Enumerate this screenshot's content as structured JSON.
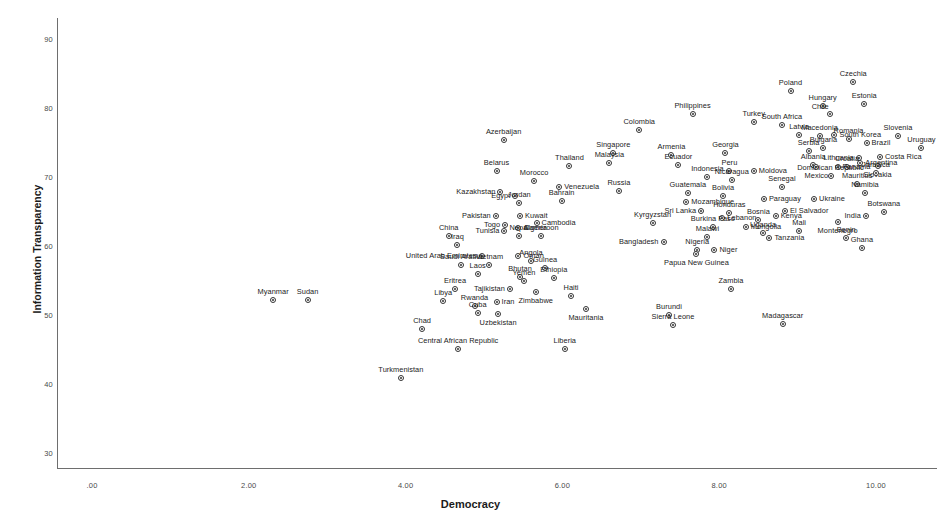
{
  "chart_data": {
    "type": "scatter",
    "title": "",
    "xlabel": "Democracy",
    "ylabel": "Information Transparency",
    "xlim": [
      -0.45,
      10.8
    ],
    "ylim": [
      27.8,
      92.0
    ],
    "xticks": [
      ".00",
      "2.00",
      "4.00",
      "6.00",
      "8.00",
      "10.00"
    ],
    "xtick_values": [
      0,
      2,
      4,
      6,
      8,
      10
    ],
    "yticks": [
      "30",
      "40",
      "50",
      "60",
      "70",
      "80",
      "90"
    ],
    "ytick_values": [
      30,
      40,
      50,
      60,
      70,
      80,
      90
    ],
    "grid": false,
    "legend": null,
    "marker_color": "#333333",
    "points": [
      {
        "label": "Czechia",
        "x": 9.71,
        "y": 83.8,
        "pos": "t"
      },
      {
        "label": "Poland",
        "x": 8.91,
        "y": 82.5,
        "pos": "t"
      },
      {
        "label": "Estonia",
        "x": 9.85,
        "y": 80.6,
        "pos": "t"
      },
      {
        "label": "Hungary",
        "x": 9.32,
        "y": 80.3,
        "pos": "t"
      },
      {
        "label": "Chile",
        "x": 9.41,
        "y": 79.1,
        "pos": "tl"
      },
      {
        "label": "Philippines",
        "x": 7.66,
        "y": 79.1,
        "pos": "t"
      },
      {
        "label": "South Africa",
        "x": 8.8,
        "y": 77.5,
        "pos": "t"
      },
      {
        "label": "Turkey",
        "x": 8.44,
        "y": 78.0,
        "pos": "t"
      },
      {
        "label": "Colombia",
        "x": 6.98,
        "y": 76.8,
        "pos": "t"
      },
      {
        "label": "Latvia",
        "x": 9.02,
        "y": 76.1,
        "pos": "t"
      },
      {
        "label": "South Korea",
        "x": 9.47,
        "y": 76.1,
        "pos": "r"
      },
      {
        "label": "Macedonia",
        "x": 9.28,
        "y": 76.0,
        "pos": "t"
      },
      {
        "label": "Slovenia",
        "x": 10.28,
        "y": 76.0,
        "pos": "t"
      },
      {
        "label": "Romania",
        "x": 9.65,
        "y": 75.5,
        "pos": "t"
      },
      {
        "label": "Azerbaijan",
        "x": 5.25,
        "y": 75.4,
        "pos": "t"
      },
      {
        "label": "Brazil",
        "x": 9.88,
        "y": 74.9,
        "pos": "r"
      },
      {
        "label": "Bulgaria",
        "x": 9.33,
        "y": 74.2,
        "pos": "t"
      },
      {
        "label": "Uruguay",
        "x": 10.58,
        "y": 74.2,
        "pos": "t"
      },
      {
        "label": "Singapore",
        "x": 6.65,
        "y": 73.5,
        "pos": "t"
      },
      {
        "label": "Serbia",
        "x": 9.14,
        "y": 73.7,
        "pos": "t"
      },
      {
        "label": "Armenia",
        "x": 7.39,
        "y": 73.2,
        "pos": "t"
      },
      {
        "label": "Georgia",
        "x": 8.08,
        "y": 73.5,
        "pos": "t"
      },
      {
        "label": "Costa Rica",
        "x": 10.05,
        "y": 72.9,
        "pos": "r"
      },
      {
        "label": "Lithuania",
        "x": 9.78,
        "y": 72.7,
        "pos": "l"
      },
      {
        "label": "Argentina",
        "x": 9.8,
        "y": 72.1,
        "pos": "r"
      },
      {
        "label": "Malaysia",
        "x": 6.6,
        "y": 72.0,
        "pos": "t"
      },
      {
        "label": "Albania",
        "x": 9.2,
        "y": 71.8,
        "pos": "t"
      },
      {
        "label": "Ecuador",
        "x": 7.48,
        "y": 71.8,
        "pos": "t"
      },
      {
        "label": "Slovakia",
        "x": 10.02,
        "y": 71.6,
        "pos": "b"
      },
      {
        "label": "Croatia",
        "x": 9.63,
        "y": 71.4,
        "pos": "t"
      },
      {
        "label": "Thailand",
        "x": 6.09,
        "y": 71.6,
        "pos": "t"
      },
      {
        "label": "Mexico",
        "x": 9.24,
        "y": 71.4,
        "pos": "b"
      },
      {
        "label": "Panama",
        "x": 9.51,
        "y": 71.4,
        "pos": "r"
      },
      {
        "label": "Belarus",
        "x": 5.16,
        "y": 70.8,
        "pos": "t"
      },
      {
        "label": "Jamaica",
        "x": 10.0,
        "y": 70.6,
        "pos": "t"
      },
      {
        "label": "Peru",
        "x": 8.13,
        "y": 70.9,
        "pos": "t"
      },
      {
        "label": "Moldova",
        "x": 8.44,
        "y": 70.8,
        "pos": "r"
      },
      {
        "label": "Dominican Republic",
        "x": 9.42,
        "y": 70.2,
        "pos": "t"
      },
      {
        "label": "Indonesia",
        "x": 7.85,
        "y": 70.0,
        "pos": "t"
      },
      {
        "label": "Morocco",
        "x": 5.64,
        "y": 69.4,
        "pos": "t"
      },
      {
        "label": "Nicaragua",
        "x": 8.16,
        "y": 69.5,
        "pos": "t"
      },
      {
        "label": "Mauritius",
        "x": 9.76,
        "y": 69.0,
        "pos": "t"
      },
      {
        "label": "Venezuela",
        "x": 5.96,
        "y": 68.6,
        "pos": "r"
      },
      {
        "label": "Senegal",
        "x": 8.8,
        "y": 68.6,
        "pos": "t"
      },
      {
        "label": "Kazakhstan",
        "x": 5.21,
        "y": 67.8,
        "pos": "l"
      },
      {
        "label": "Russia",
        "x": 6.72,
        "y": 67.9,
        "pos": "t"
      },
      {
        "label": "Namibia",
        "x": 9.86,
        "y": 67.7,
        "pos": "t"
      },
      {
        "label": "Guatemala",
        "x": 7.6,
        "y": 67.7,
        "pos": "t"
      },
      {
        "label": "Egypt",
        "x": 5.4,
        "y": 67.3,
        "pos": "l"
      },
      {
        "label": "Bolivia",
        "x": 8.05,
        "y": 67.2,
        "pos": "t"
      },
      {
        "label": "Paraguay",
        "x": 8.57,
        "y": 66.8,
        "pos": "r"
      },
      {
        "label": "Ukraine",
        "x": 9.21,
        "y": 66.8,
        "pos": "r"
      },
      {
        "label": "Bahrain",
        "x": 5.99,
        "y": 66.5,
        "pos": "t"
      },
      {
        "label": "Mozambique",
        "x": 7.58,
        "y": 66.4,
        "pos": "r"
      },
      {
        "label": "Jordan",
        "x": 5.45,
        "y": 66.2,
        "pos": "t"
      },
      {
        "label": "Botswana",
        "x": 10.1,
        "y": 65.0,
        "pos": "t"
      },
      {
        "label": "Sri Lanka",
        "x": 7.77,
        "y": 65.1,
        "pos": "l"
      },
      {
        "label": "Honduras",
        "x": 8.13,
        "y": 64.8,
        "pos": "t"
      },
      {
        "label": "El Salvador",
        "x": 8.84,
        "y": 65.1,
        "pos": "r"
      },
      {
        "label": "India",
        "x": 9.87,
        "y": 64.3,
        "pos": "l"
      },
      {
        "label": "Pakistan",
        "x": 5.15,
        "y": 64.4,
        "pos": "l"
      },
      {
        "label": "Kuwait",
        "x": 5.46,
        "y": 64.3,
        "pos": "r"
      },
      {
        "label": "Kenya",
        "x": 8.72,
        "y": 64.4,
        "pos": "r"
      },
      {
        "label": "Lebanon",
        "x": 8.04,
        "y": 64.0,
        "pos": "r"
      },
      {
        "label": "Bosnia",
        "x": 8.5,
        "y": 63.7,
        "pos": "t"
      },
      {
        "label": "Montenegro",
        "x": 9.51,
        "y": 63.5,
        "pos": "b"
      },
      {
        "label": "Togo",
        "x": 5.27,
        "y": 63.1,
        "pos": "l"
      },
      {
        "label": "Cambodia",
        "x": 5.67,
        "y": 63.3,
        "pos": "r"
      },
      {
        "label": "Kyrgyzstan",
        "x": 7.15,
        "y": 63.3,
        "pos": "t"
      },
      {
        "label": "Burkina Faso",
        "x": 7.92,
        "y": 62.8,
        "pos": "t"
      },
      {
        "label": "Mongolia",
        "x": 8.34,
        "y": 62.8,
        "pos": "r"
      },
      {
        "label": "Algeria",
        "x": 5.44,
        "y": 62.6,
        "pos": "r"
      },
      {
        "label": "Tunisia",
        "x": 5.26,
        "y": 62.2,
        "pos": "l"
      },
      {
        "label": "Mali",
        "x": 9.02,
        "y": 62.2,
        "pos": "t"
      },
      {
        "label": "Uganda",
        "x": 8.56,
        "y": 61.9,
        "pos": "t"
      },
      {
        "label": "Nepal",
        "x": 5.45,
        "y": 61.4,
        "pos": "t"
      },
      {
        "label": "Cameroon",
        "x": 5.73,
        "y": 61.4,
        "pos": "t"
      },
      {
        "label": "Malawi",
        "x": 7.85,
        "y": 61.3,
        "pos": "t"
      },
      {
        "label": "China",
        "x": 4.55,
        "y": 61.5,
        "pos": "t"
      },
      {
        "label": "Tanzania",
        "x": 8.64,
        "y": 61.2,
        "pos": "r"
      },
      {
        "label": "Benin",
        "x": 9.62,
        "y": 61.1,
        "pos": "t"
      },
      {
        "label": "Bangladesh",
        "x": 7.29,
        "y": 60.6,
        "pos": "l"
      },
      {
        "label": "Ghana",
        "x": 9.82,
        "y": 59.7,
        "pos": "t"
      },
      {
        "label": "Iraq",
        "x": 4.66,
        "y": 60.2,
        "pos": "t"
      },
      {
        "label": "Nigeria",
        "x": 7.72,
        "y": 59.4,
        "pos": "t"
      },
      {
        "label": "Niger",
        "x": 7.94,
        "y": 59.4,
        "pos": "r"
      },
      {
        "label": "Papua New Guinea",
        "x": 7.71,
        "y": 58.9,
        "pos": "b"
      },
      {
        "label": "United Arab Emirates",
        "x": 4.97,
        "y": 58.5,
        "pos": "l"
      },
      {
        "label": "Oman",
        "x": 5.44,
        "y": 58.5,
        "pos": "r"
      },
      {
        "label": "Angola",
        "x": 5.6,
        "y": 57.8,
        "pos": "t"
      },
      {
        "label": "Saudi Arabia",
        "x": 4.71,
        "y": 57.2,
        "pos": "t"
      },
      {
        "label": "Vietnam",
        "x": 5.07,
        "y": 57.2,
        "pos": "t"
      },
      {
        "label": "Guinea",
        "x": 5.78,
        "y": 56.8,
        "pos": "t"
      },
      {
        "label": "Laos",
        "x": 4.92,
        "y": 55.9,
        "pos": "t"
      },
      {
        "label": "Bhutan",
        "x": 5.46,
        "y": 55.5,
        "pos": "t"
      },
      {
        "label": "Ethiopia",
        "x": 5.89,
        "y": 55.4,
        "pos": "t"
      },
      {
        "label": "Yemen",
        "x": 5.51,
        "y": 54.9,
        "pos": "t"
      },
      {
        "label": "Zambia",
        "x": 8.15,
        "y": 53.7,
        "pos": "t"
      },
      {
        "label": "Eritrea",
        "x": 4.63,
        "y": 53.8,
        "pos": "t"
      },
      {
        "label": "Tajikistan",
        "x": 5.33,
        "y": 53.8,
        "pos": "l"
      },
      {
        "label": "Zimbabwe",
        "x": 5.66,
        "y": 53.3,
        "pos": "b"
      },
      {
        "label": "Haiti",
        "x": 6.11,
        "y": 52.7,
        "pos": "t"
      },
      {
        "label": "Myanmar",
        "x": 2.31,
        "y": 52.2,
        "pos": "t"
      },
      {
        "label": "Sudan",
        "x": 2.75,
        "y": 52.2,
        "pos": "t"
      },
      {
        "label": "Libya",
        "x": 4.48,
        "y": 52.0,
        "pos": "t"
      },
      {
        "label": "Iran",
        "x": 5.16,
        "y": 51.9,
        "pos": "r"
      },
      {
        "label": "Rwanda",
        "x": 4.88,
        "y": 51.3,
        "pos": "t"
      },
      {
        "label": "Mauritania",
        "x": 6.3,
        "y": 50.8,
        "pos": "b"
      },
      {
        "label": "Cuba",
        "x": 4.92,
        "y": 50.3,
        "pos": "t"
      },
      {
        "label": "Burundi",
        "x": 7.36,
        "y": 50.0,
        "pos": "t"
      },
      {
        "label": "Uzbekistan",
        "x": 5.18,
        "y": 50.2,
        "pos": "b"
      },
      {
        "label": "Sierra Leone",
        "x": 7.41,
        "y": 48.5,
        "pos": "t"
      },
      {
        "label": "Madagascar",
        "x": 8.81,
        "y": 48.7,
        "pos": "t"
      },
      {
        "label": "Chad",
        "x": 4.21,
        "y": 48.0,
        "pos": "t"
      },
      {
        "label": "Central African Republic",
        "x": 4.67,
        "y": 45.1,
        "pos": "t"
      },
      {
        "label": "Liberia",
        "x": 6.03,
        "y": 45.1,
        "pos": "t"
      },
      {
        "label": "Turkmenistan",
        "x": 3.94,
        "y": 40.9,
        "pos": "t"
      }
    ]
  }
}
